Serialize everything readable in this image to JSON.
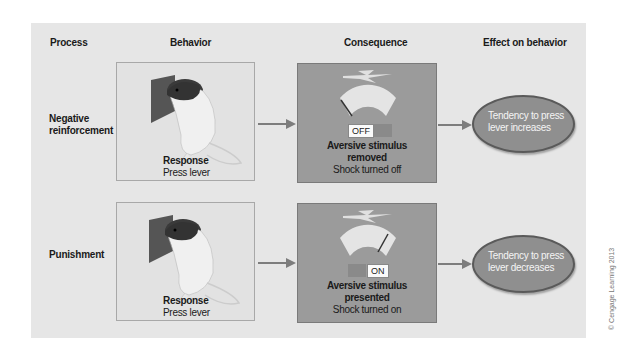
{
  "headers": {
    "process": "Process",
    "behavior": "Behavior",
    "consequence": "Consequence",
    "effect": "Effect on behavior"
  },
  "rows": [
    {
      "process": "Negative reinforcement",
      "process_line1": "Negative",
      "process_line2": "reinforcement",
      "behavior_title": "Response",
      "behavior_sub": "Press lever",
      "switch_label": "OFF",
      "consequence_title_line1": "Aversive stimulus",
      "consequence_title_line2": "removed",
      "consequence_sub": "Shock turned off",
      "effect_line1": "Tendency to press",
      "effect_line2": "lever increases"
    },
    {
      "process": "Punishment",
      "behavior_title": "Response",
      "behavior_sub": "Press lever",
      "switch_label": "ON",
      "consequence_title_line1": "Aversive stimulus",
      "consequence_title_line2": "presented",
      "consequence_sub": "Shock turned on",
      "effect_line1": "Tendency to press",
      "effect_line2": "lever decreases"
    }
  ],
  "credit": "© Cengage Learning 2013",
  "colors": {
    "panel": "#e6e6e6",
    "consequence_box": "#9b9b9b",
    "effect_ellipse": "#8f8f8f",
    "arrow": "#7d7d7d"
  }
}
